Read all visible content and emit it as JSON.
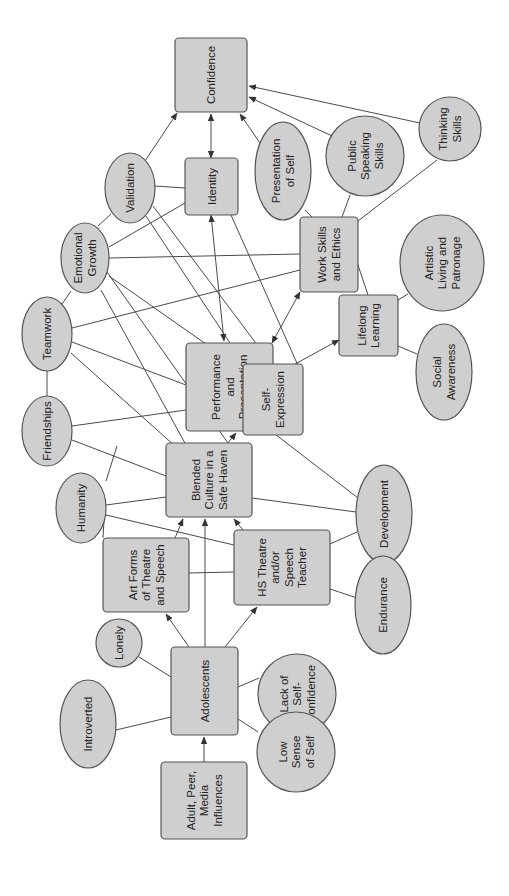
{
  "diagram": {
    "orientation": "rotated-90-ccw",
    "colors": {
      "node_fill": "#cfcfcf",
      "node_stroke": "#555555",
      "edge": "#4a4a4a",
      "text": "#222222"
    },
    "nodes": [
      {
        "id": "confidence",
        "shape": "rect",
        "x": 175,
        "y": 38,
        "w": 72,
        "h": 74,
        "lines": [
          "Confidence"
        ]
      },
      {
        "id": "identity",
        "shape": "rect",
        "x": 185,
        "y": 158,
        "w": 53,
        "h": 57,
        "lines": [
          "Identity"
        ]
      },
      {
        "id": "validation",
        "shape": "ellipse",
        "cx": 130,
        "cy": 188,
        "rx": 25,
        "ry": 35,
        "lines": [
          "Validation"
        ]
      },
      {
        "id": "emotional-growth",
        "shape": "ellipse",
        "cx": 85,
        "cy": 258,
        "rx": 24,
        "ry": 35,
        "lines": [
          "Emotional",
          "Growth"
        ]
      },
      {
        "id": "teamwork",
        "shape": "ellipse",
        "cx": 47,
        "cy": 334,
        "rx": 25,
        "ry": 37,
        "lines": [
          "Teamwork"
        ]
      },
      {
        "id": "friendships",
        "shape": "ellipse",
        "cx": 47,
        "cy": 431,
        "rx": 25,
        "ry": 35,
        "lines": [
          "Friendships"
        ]
      },
      {
        "id": "humanity",
        "shape": "ellipse",
        "cx": 81,
        "cy": 508,
        "rx": 25,
        "ry": 35,
        "lines": [
          "Humanity"
        ]
      },
      {
        "id": "performance",
        "shape": "rect",
        "x": 186,
        "y": 343,
        "w": 87,
        "h": 88,
        "lines": [
          "Performance",
          "and",
          "Presentation"
        ]
      },
      {
        "id": "self-expression",
        "shape": "rect",
        "x": 243,
        "y": 364,
        "w": 60,
        "h": 71,
        "lines": [
          "Self-",
          "Expression"
        ]
      },
      {
        "id": "work-skills",
        "shape": "rect",
        "x": 300,
        "y": 217,
        "w": 58,
        "h": 75,
        "lines": [
          "Work Skills",
          "and Ethics"
        ]
      },
      {
        "id": "lifelong-learning",
        "shape": "rect",
        "x": 339,
        "y": 295,
        "w": 59,
        "h": 61,
        "lines": [
          "Lifelong",
          "Learning"
        ]
      },
      {
        "id": "presentation-of-self",
        "shape": "ellipse",
        "cx": 283,
        "cy": 171,
        "rx": 28,
        "ry": 49,
        "lines": [
          "Presentation",
          "of Self"
        ]
      },
      {
        "id": "public-speaking",
        "shape": "ellipse",
        "cx": 365,
        "cy": 156,
        "rx": 39,
        "ry": 40,
        "lines": [
          "Public",
          "Speaking",
          "Skills"
        ]
      },
      {
        "id": "thinking-skills",
        "shape": "ellipse",
        "cx": 450,
        "cy": 129,
        "rx": 31,
        "ry": 32,
        "lines": [
          "Thinking",
          "Skills"
        ]
      },
      {
        "id": "artistic-living",
        "shape": "ellipse",
        "cx": 442,
        "cy": 263,
        "rx": 42,
        "ry": 48,
        "lines": [
          "Artistic",
          "Living and",
          "Patronage"
        ]
      },
      {
        "id": "social-awareness",
        "shape": "ellipse",
        "cx": 444,
        "cy": 372,
        "rx": 28,
        "ry": 48,
        "lines": [
          "Social",
          "Awareness"
        ]
      },
      {
        "id": "blended-culture",
        "shape": "rect",
        "x": 166,
        "y": 443,
        "w": 86,
        "h": 74,
        "lines": [
          "Blended",
          "Culture in a",
          "Safe Haven"
        ]
      },
      {
        "id": "art-forms",
        "shape": "rect",
        "x": 103,
        "y": 538,
        "w": 86,
        "h": 74,
        "lines": [
          "Art Forms",
          "of Theatre",
          "and Speech"
        ]
      },
      {
        "id": "hs-teacher",
        "shape": "rect",
        "x": 234,
        "y": 530,
        "w": 96,
        "h": 75,
        "lines": [
          "HS Theatre",
          "and/or",
          "Speech",
          "Teacher"
        ]
      },
      {
        "id": "development",
        "shape": "ellipse",
        "cx": 384,
        "cy": 514,
        "rx": 28,
        "ry": 49,
        "lines": [
          "Development"
        ]
      },
      {
        "id": "endurance",
        "shape": "ellipse",
        "cx": 383,
        "cy": 605,
        "rx": 28,
        "ry": 49,
        "lines": [
          "Endurance"
        ]
      },
      {
        "id": "lonely",
        "shape": "ellipse",
        "cx": 119,
        "cy": 643,
        "rx": 23,
        "ry": 24,
        "lines": [
          "Lonely"
        ]
      },
      {
        "id": "introverted",
        "shape": "ellipse",
        "cx": 88,
        "cy": 724,
        "rx": 28,
        "ry": 44,
        "lines": [
          "Introverted"
        ]
      },
      {
        "id": "adolescents",
        "shape": "rect",
        "x": 171,
        "y": 647,
        "w": 67,
        "h": 88,
        "lines": [
          "Adolescents"
        ]
      },
      {
        "id": "lack-confidence",
        "shape": "ellipse",
        "cx": 297,
        "cy": 694,
        "rx": 39,
        "ry": 40,
        "lines": [
          "Lack of",
          "Self-",
          "Confidence"
        ]
      },
      {
        "id": "low-sense",
        "shape": "ellipse",
        "cx": 296,
        "cy": 752,
        "rx": 39,
        "ry": 40,
        "lines": [
          "Low",
          "Sense",
          "of Self"
        ]
      },
      {
        "id": "influences",
        "shape": "rect",
        "x": 161,
        "y": 762,
        "w": 86,
        "h": 77,
        "lines": [
          "Adult, Peer,",
          "Media",
          "Influences"
        ]
      }
    ],
    "edges": [
      {
        "x1": 204,
        "y1": 762,
        "x2": 204,
        "y2": 737,
        "arrow": "end"
      },
      {
        "x1": 189,
        "y1": 647,
        "x2": 166,
        "y2": 614,
        "arrow": "end"
      },
      {
        "x1": 205,
        "y1": 647,
        "x2": 205,
        "y2": 519,
        "arrow": "end"
      },
      {
        "x1": 225,
        "y1": 647,
        "x2": 257,
        "y2": 607,
        "arrow": "end"
      },
      {
        "x1": 171,
        "y1": 677,
        "x2": 139,
        "y2": 657
      },
      {
        "x1": 171,
        "y1": 717,
        "x2": 116,
        "y2": 730
      },
      {
        "x1": 238,
        "y1": 687,
        "x2": 259,
        "y2": 678
      },
      {
        "x1": 238,
        "y1": 719,
        "x2": 258,
        "y2": 732
      },
      {
        "x1": 175,
        "y1": 538,
        "x2": 183,
        "y2": 519,
        "arrow": "end"
      },
      {
        "x1": 189,
        "y1": 573,
        "x2": 234,
        "y2": 572
      },
      {
        "x1": 243,
        "y1": 530,
        "x2": 234,
        "y2": 519,
        "arrow": "end"
      },
      {
        "x1": 330,
        "y1": 544,
        "x2": 357,
        "y2": 532
      },
      {
        "x1": 330,
        "y1": 589,
        "x2": 357,
        "y2": 598
      },
      {
        "x1": 384,
        "y1": 563,
        "x2": 384,
        "y2": 556,
        "arrow": "both"
      },
      {
        "x1": 252,
        "y1": 498,
        "x2": 356,
        "y2": 512
      },
      {
        "x1": 271,
        "y1": 431,
        "x2": 358,
        "y2": 498
      },
      {
        "x1": 228,
        "y1": 443,
        "x2": 236,
        "y2": 433,
        "arrow": "end"
      },
      {
        "x1": 104,
        "y1": 521,
        "x2": 103,
        "y2": 538
      },
      {
        "x1": 106,
        "y1": 505,
        "x2": 166,
        "y2": 497
      },
      {
        "x1": 106,
        "y1": 515,
        "x2": 234,
        "y2": 545
      },
      {
        "x1": 67,
        "y1": 481,
        "x2": 74,
        "y2": 474
      },
      {
        "x1": 72,
        "y1": 440,
        "x2": 166,
        "y2": 476
      },
      {
        "x1": 72,
        "y1": 426,
        "x2": 186,
        "y2": 410
      },
      {
        "x1": 47,
        "y1": 371,
        "x2": 47,
        "y2": 396
      },
      {
        "x1": 71,
        "y1": 353,
        "x2": 185,
        "y2": 455
      },
      {
        "x1": 72,
        "y1": 342,
        "x2": 186,
        "y2": 385
      },
      {
        "x1": 72,
        "y1": 328,
        "x2": 300,
        "y2": 270
      },
      {
        "x1": 62,
        "y1": 304,
        "x2": 71,
        "y2": 291
      },
      {
        "x1": 117,
        "y1": 446,
        "x2": 106,
        "y2": 481
      },
      {
        "x1": 109,
        "y1": 258,
        "x2": 300,
        "y2": 254
      },
      {
        "x1": 109,
        "y1": 247,
        "x2": 185,
        "y2": 203
      },
      {
        "x1": 107,
        "y1": 272,
        "x2": 240,
        "y2": 460
      },
      {
        "x1": 101,
        "y1": 290,
        "x2": 186,
        "y2": 445
      },
      {
        "x1": 109,
        "y1": 276,
        "x2": 243,
        "y2": 370
      },
      {
        "x1": 98,
        "y1": 226,
        "x2": 111,
        "y2": 214
      },
      {
        "x1": 155,
        "y1": 186,
        "x2": 185,
        "y2": 188
      },
      {
        "x1": 145,
        "y1": 161,
        "x2": 177,
        "y2": 113,
        "arrow": "end"
      },
      {
        "x1": 146,
        "y1": 216,
        "x2": 230,
        "y2": 343
      },
      {
        "x1": 153,
        "y1": 206,
        "x2": 303,
        "y2": 406
      },
      {
        "x1": 211,
        "y1": 215,
        "x2": 224,
        "y2": 341,
        "arrow": "both"
      },
      {
        "x1": 231,
        "y1": 215,
        "x2": 300,
        "y2": 370
      },
      {
        "x1": 211,
        "y1": 158,
        "x2": 211,
        "y2": 114,
        "arrow": "both"
      },
      {
        "x1": 260,
        "y1": 143,
        "x2": 240,
        "y2": 114,
        "arrow": "end"
      },
      {
        "x1": 332,
        "y1": 136,
        "x2": 249,
        "y2": 97,
        "arrow": "end"
      },
      {
        "x1": 420,
        "y1": 123,
        "x2": 249,
        "y2": 86,
        "arrow": "end"
      },
      {
        "x1": 305,
        "y1": 210,
        "x2": 312,
        "y2": 217
      },
      {
        "x1": 350,
        "y1": 195,
        "x2": 342,
        "y2": 217
      },
      {
        "x1": 437,
        "y1": 160,
        "x2": 358,
        "y2": 221
      },
      {
        "x1": 355,
        "y1": 256,
        "x2": 368,
        "y2": 295
      },
      {
        "x1": 398,
        "y1": 300,
        "x2": 408,
        "y2": 294
      },
      {
        "x1": 398,
        "y1": 346,
        "x2": 417,
        "y2": 354
      },
      {
        "x1": 300,
        "y1": 292,
        "x2": 272,
        "y2": 343,
        "arrow": "both"
      },
      {
        "x1": 339,
        "y1": 340,
        "x2": 275,
        "y2": 375,
        "arrow": "both"
      },
      {
        "x1": 273,
        "y1": 400,
        "x2": 243,
        "y2": 400
      }
    ]
  }
}
